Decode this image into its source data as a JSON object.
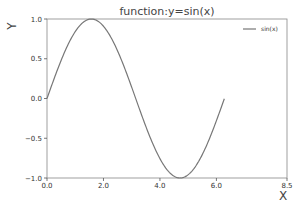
{
  "chart_data": {
    "type": "line",
    "title": "function:y=sin(x)",
    "xlabel": "X",
    "ylabel": "Y",
    "xlim": [
      0,
      8.5
    ],
    "ylim": [
      -1.0,
      1.0
    ],
    "xticks": [
      0.0,
      2.0,
      4.0,
      6.0,
      8.5
    ],
    "xtick_labels": [
      "0.0",
      "2.0",
      "4.0",
      "6.0",
      "8.5"
    ],
    "yticks": [
      -1.0,
      -0.5,
      0.0,
      0.5,
      1.0
    ],
    "ytick_labels": [
      "−1.0",
      "−0.5",
      "0.0",
      "0.5",
      "1.0"
    ],
    "grid": false,
    "legend_position": "upper right",
    "series": [
      {
        "name": "sin(x)",
        "color": "#777777",
        "function": "sin(x)",
        "x_start": 0,
        "x_end": 6.28,
        "points": [
          [
            0,
            0
          ],
          [
            0.785,
            0.707
          ],
          [
            1.571,
            1.0
          ],
          [
            2.356,
            0.707
          ],
          [
            3.142,
            0.0
          ],
          [
            3.927,
            -0.707
          ],
          [
            4.712,
            -1.0
          ],
          [
            5.498,
            -0.707
          ],
          [
            6.283,
            0.0
          ]
        ]
      }
    ]
  }
}
